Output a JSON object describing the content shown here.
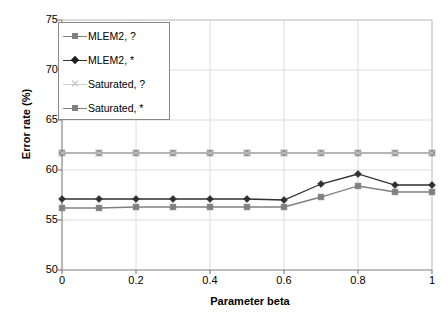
{
  "chart_data": {
    "type": "line",
    "title": "",
    "xlabel": "Parameter beta",
    "ylabel": "Error rate (%)",
    "xlim": [
      0,
      1
    ],
    "ylim": [
      50,
      75
    ],
    "xticks": [
      "0",
      "0.2",
      "0.4",
      "0.6",
      "0.8",
      "1"
    ],
    "xtick_values": [
      0,
      0.2,
      0.4,
      0.6,
      0.8,
      1
    ],
    "yticks": [
      "50",
      "55",
      "60",
      "65",
      "70",
      "75"
    ],
    "ytick_values": [
      50,
      55,
      60,
      65,
      70,
      75
    ],
    "grid": true,
    "legend_position": "top-left",
    "x": [
      0,
      0.1,
      0.2,
      0.3,
      0.4,
      0.5,
      0.6,
      0.7,
      0.8,
      0.9,
      1
    ],
    "series": [
      {
        "name": "MLEM2, ?",
        "marker": "square",
        "color": "#808080",
        "values": [
          56.2,
          56.2,
          56.3,
          56.3,
          56.3,
          56.3,
          56.3,
          57.3,
          58.4,
          57.8,
          57.8
        ]
      },
      {
        "name": "MLEM2, *",
        "marker": "diamond",
        "color": "#303030",
        "values": [
          57.1,
          57.1,
          57.1,
          57.1,
          57.1,
          57.1,
          57.0,
          58.6,
          59.6,
          58.5,
          58.5
        ]
      },
      {
        "name": "Saturated, ?",
        "marker": "cross",
        "color": "#bdbdbd",
        "values": [
          61.7,
          61.7,
          61.7,
          61.7,
          61.7,
          61.7,
          61.7,
          61.7,
          61.7,
          61.7,
          61.7
        ]
      },
      {
        "name": "Saturated, *",
        "marker": "square",
        "color": "#808080",
        "values": [
          61.7,
          61.7,
          61.7,
          61.7,
          61.7,
          61.7,
          61.7,
          61.7,
          61.7,
          61.7,
          61.7
        ]
      }
    ]
  },
  "legend": {
    "items": [
      {
        "label": "MLEM2, ?"
      },
      {
        "label": "MLEM2, *"
      },
      {
        "label": "Saturated, ?"
      },
      {
        "label": "Saturated, *"
      }
    ]
  },
  "axes": {
    "x_title": "Parameter beta",
    "y_title": "Error rate (%)"
  }
}
